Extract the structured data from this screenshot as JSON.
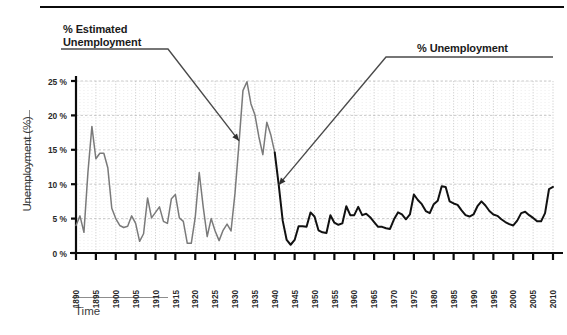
{
  "figure": {
    "callout_estimated": "% Estimated\nUnemployment",
    "callout_actual": "% Unemployment",
    "top_rule_color": "#0b0b0b"
  },
  "axes": {
    "ylabel": "Unemployment (%)",
    "xlabel": "Time",
    "y_ticks": [
      "0 %",
      "5 %",
      "10 %",
      "15 %",
      "20 %",
      "25 %"
    ],
    "x_ticks": [
      "1890",
      "1895",
      "1900",
      "1905",
      "1910",
      "1915",
      "1920",
      "1925",
      "1930",
      "1935",
      "1940",
      "1945",
      "1950",
      "1955",
      "1960",
      "1965",
      "1970",
      "1975",
      "1980",
      "1985",
      "1990",
      "1995",
      "2000",
      "2005",
      "2010"
    ]
  },
  "chart_data": {
    "type": "line",
    "title": "",
    "subtitle": "",
    "xlabel": "Time",
    "ylabel": "Unemployment (%)",
    "xlim": [
      1890,
      2010
    ],
    "ylim": [
      0,
      25
    ],
    "ytick_values": [
      0,
      5,
      10,
      15,
      20,
      25
    ],
    "ytick_labels": [
      "0 %",
      "5 %",
      "10 %",
      "15 %",
      "20 %",
      "25 %"
    ],
    "xtick_values": [
      1890,
      1895,
      1900,
      1905,
      1910,
      1915,
      1920,
      1925,
      1930,
      1935,
      1940,
      1945,
      1950,
      1955,
      1960,
      1965,
      1970,
      1975,
      1980,
      1985,
      1990,
      1995,
      2000,
      2005,
      2010
    ],
    "grid": {
      "vertical": "dotted-every-year",
      "horizontal": "dashed-every-5-percent"
    },
    "legend": {
      "position": "callout-labels",
      "entries": [
        "% Estimated Unemployment",
        "% Unemployment"
      ]
    },
    "annotations": [
      {
        "text": "% Estimated Unemployment",
        "points_to_year": 1931,
        "points_to_value": 16.3
      },
      {
        "text": "% Unemployment",
        "points_to_year": 1941,
        "points_to_value": 9.9
      }
    ],
    "series": [
      {
        "name": "% Estimated Unemployment",
        "color": "#7a7a7a",
        "x": [
          1890,
          1891,
          1892,
          1893,
          1894,
          1895,
          1896,
          1897,
          1898,
          1899,
          1900,
          1901,
          1902,
          1903,
          1904,
          1905,
          1906,
          1907,
          1908,
          1909,
          1910,
          1911,
          1912,
          1913,
          1914,
          1915,
          1916,
          1917,
          1918,
          1919,
          1920,
          1921,
          1922,
          1923,
          1924,
          1925,
          1926,
          1927,
          1928,
          1929,
          1930,
          1931,
          1932,
          1933,
          1934,
          1935,
          1936,
          1937,
          1938,
          1939,
          1940
        ],
        "values": [
          4.0,
          5.4,
          3.0,
          11.7,
          18.4,
          13.7,
          14.5,
          14.5,
          12.4,
          6.5,
          5.0,
          4.0,
          3.7,
          3.9,
          5.4,
          4.3,
          1.7,
          2.8,
          8.0,
          5.1,
          5.9,
          6.7,
          4.6,
          4.3,
          7.9,
          8.5,
          5.1,
          4.6,
          1.4,
          1.4,
          5.2,
          11.7,
          6.7,
          2.4,
          5.0,
          3.2,
          1.8,
          3.3,
          4.2,
          3.2,
          8.7,
          15.9,
          23.6,
          24.9,
          21.7,
          20.1,
          16.9,
          14.3,
          19.0,
          17.2,
          14.6
        ]
      },
      {
        "name": "% Unemployment",
        "color": "#111111",
        "x": [
          1940,
          1941,
          1942,
          1943,
          1944,
          1945,
          1946,
          1947,
          1948,
          1949,
          1950,
          1951,
          1952,
          1953,
          1954,
          1955,
          1956,
          1957,
          1958,
          1959,
          1960,
          1961,
          1962,
          1963,
          1964,
          1965,
          1966,
          1967,
          1968,
          1969,
          1970,
          1971,
          1972,
          1973,
          1974,
          1975,
          1976,
          1977,
          1978,
          1979,
          1980,
          1981,
          1982,
          1983,
          1984,
          1985,
          1986,
          1987,
          1988,
          1989,
          1990,
          1991,
          1992,
          1993,
          1994,
          1995,
          1996,
          1997,
          1998,
          1999,
          2000,
          2001,
          2002,
          2003,
          2004,
          2005,
          2006,
          2007,
          2008,
          2009,
          2010
        ],
        "values": [
          14.6,
          9.9,
          4.7,
          1.9,
          1.2,
          1.9,
          3.9,
          3.9,
          3.8,
          5.9,
          5.3,
          3.3,
          3.0,
          2.9,
          5.5,
          4.4,
          4.1,
          4.3,
          6.8,
          5.5,
          5.5,
          6.7,
          5.5,
          5.7,
          5.2,
          4.5,
          3.8,
          3.8,
          3.6,
          3.5,
          4.9,
          5.9,
          5.6,
          4.9,
          5.6,
          8.5,
          7.7,
          7.1,
          6.1,
          5.8,
          7.1,
          7.6,
          9.7,
          9.6,
          7.5,
          7.2,
          7.0,
          6.2,
          5.5,
          5.3,
          5.6,
          6.8,
          7.5,
          6.9,
          6.1,
          5.6,
          5.4,
          4.9,
          4.5,
          4.2,
          4.0,
          4.7,
          5.8,
          6.0,
          5.5,
          5.1,
          4.6,
          4.6,
          5.8,
          9.3,
          9.6
        ]
      }
    ]
  }
}
